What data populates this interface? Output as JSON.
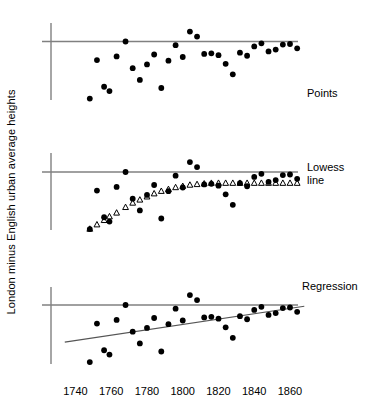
{
  "chart_data": {
    "type": "scatter",
    "title": "",
    "xlabel": "",
    "ylabel": "London minus English urban average heights",
    "xlim": [
      1733,
      1869
    ],
    "ylim": [
      -1.0,
      0.42
    ],
    "grid": false,
    "legend": "none",
    "panel_labels": [
      "Points",
      "Lowess\nline",
      "Regression"
    ],
    "xticks": [
      1740,
      1760,
      1780,
      1800,
      1820,
      1840,
      1860
    ],
    "xtick_labels": [
      "1740",
      "1760",
      "1780",
      "1800",
      "1820",
      "1840",
      "1860"
    ],
    "reference_line_y": 0,
    "panels": [
      {
        "name": "Points",
        "label": "Points",
        "series": [
          {
            "name": "London minus English urban average heights",
            "marker": "filled-circle",
            "x": [
              1748,
              1752,
              1756,
              1759,
              1763,
              1768,
              1772,
              1776,
              1780,
              1784,
              1788,
              1792,
              1796,
              1800,
              1804,
              1808,
              1812,
              1816,
              1820,
              1824,
              1828,
              1832,
              1836,
              1840,
              1844,
              1848,
              1852,
              1856,
              1860,
              1864
            ],
            "y": [
              -0.92,
              -0.3,
              -0.73,
              -0.8,
              -0.24,
              0.0,
              -0.43,
              -0.62,
              -0.37,
              -0.21,
              -0.75,
              -0.31,
              -0.06,
              -0.25,
              0.16,
              0.08,
              -0.2,
              -0.19,
              -0.22,
              -0.36,
              -0.53,
              -0.18,
              -0.23,
              -0.08,
              -0.03,
              -0.16,
              -0.13,
              -0.05,
              -0.04,
              -0.11
            ]
          }
        ]
      },
      {
        "name": "Lowess line",
        "label": "Lowess\nline",
        "series": [
          {
            "name": "London minus English urban average heights",
            "marker": "filled-circle",
            "x": [
              1748,
              1752,
              1756,
              1759,
              1763,
              1768,
              1772,
              1776,
              1780,
              1784,
              1788,
              1792,
              1796,
              1800,
              1804,
              1808,
              1812,
              1816,
              1820,
              1824,
              1828,
              1832,
              1836,
              1840,
              1844,
              1848,
              1852,
              1856,
              1860,
              1864
            ],
            "y": [
              -0.92,
              -0.3,
              -0.73,
              -0.8,
              -0.24,
              0.0,
              -0.43,
              -0.62,
              -0.37,
              -0.21,
              -0.75,
              -0.31,
              -0.06,
              -0.25,
              0.16,
              0.08,
              -0.2,
              -0.19,
              -0.22,
              -0.36,
              -0.53,
              -0.18,
              -0.23,
              -0.08,
              -0.03,
              -0.16,
              -0.13,
              -0.05,
              -0.04,
              -0.11
            ]
          },
          {
            "name": "Lowess smooth",
            "marker": "open-triangle",
            "x": [
              1748,
              1752,
              1756,
              1759,
              1763,
              1768,
              1772,
              1776,
              1780,
              1784,
              1788,
              1792,
              1796,
              1800,
              1804,
              1808,
              1812,
              1816,
              1820,
              1824,
              1828,
              1832,
              1836,
              1840,
              1844,
              1848,
              1852,
              1856,
              1860,
              1864
            ],
            "y": [
              -0.92,
              -0.85,
              -0.78,
              -0.72,
              -0.66,
              -0.57,
              -0.5,
              -0.45,
              -0.4,
              -0.35,
              -0.31,
              -0.28,
              -0.25,
              -0.23,
              -0.21,
              -0.2,
              -0.19,
              -0.18,
              -0.18,
              -0.18,
              -0.18,
              -0.18,
              -0.18,
              -0.18,
              -0.18,
              -0.18,
              -0.18,
              -0.18,
              -0.18,
              -0.18
            ]
          }
        ]
      },
      {
        "name": "Regression",
        "label": "Regression",
        "series": [
          {
            "name": "London minus English urban average heights",
            "marker": "filled-circle",
            "x": [
              1748,
              1752,
              1756,
              1759,
              1763,
              1768,
              1772,
              1776,
              1780,
              1784,
              1788,
              1792,
              1796,
              1800,
              1804,
              1808,
              1812,
              1816,
              1820,
              1824,
              1828,
              1832,
              1836,
              1840,
              1844,
              1848,
              1852,
              1856,
              1860,
              1864
            ],
            "y": [
              -0.92,
              -0.3,
              -0.73,
              -0.8,
              -0.24,
              0.0,
              -0.43,
              -0.62,
              -0.37,
              -0.21,
              -0.75,
              -0.31,
              -0.06,
              -0.25,
              0.16,
              0.08,
              -0.2,
              -0.19,
              -0.22,
              -0.36,
              -0.53,
              -0.18,
              -0.23,
              -0.08,
              -0.03,
              -0.16,
              -0.13,
              -0.05,
              -0.04,
              -0.11
            ]
          }
        ],
        "fit_line": {
          "name": "Least-squares regression line",
          "x": [
            1734,
            1868
          ],
          "y": [
            -0.6,
            -0.02
          ]
        }
      }
    ]
  },
  "style": {
    "marker_color": "#000000",
    "triangle_fill": "#ffffff",
    "axis_color": "#808080",
    "fit_line_color": "#555555",
    "background": "#ffffff"
  },
  "top_note": ""
}
